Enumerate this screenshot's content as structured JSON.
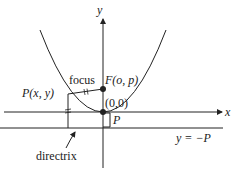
{
  "diagram": {
    "axis_labels": {
      "x": "x",
      "y": "y"
    },
    "labels": {
      "focus_word": "focus",
      "focus_point": "F(o, p)",
      "point": "P(x, y)",
      "vertex": "(0,0)",
      "distance": "P",
      "directrix_equation": "y = −P",
      "directrix_word": "directrix"
    },
    "colors": {
      "stroke": "#222222",
      "background": "#ffffff"
    }
  }
}
